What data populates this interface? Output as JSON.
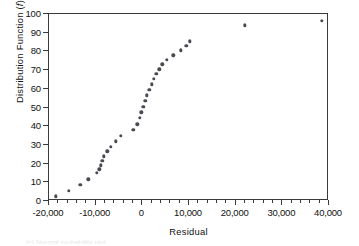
{
  "figure": {
    "background": "#ffffff",
    "marker_color": "#4a4a52",
    "axis_color": "#3a3a3a",
    "caption_remnant": "(c) Normal probability plot"
  },
  "chart_data": {
    "type": "scatter",
    "title": "",
    "xlabel": "Residual",
    "ylabel": "Distribution  Function (f)",
    "ylabel_plain": "Distribution Function",
    "ylabel_italic_symbol": "f",
    "xlim": [
      -20000,
      40000
    ],
    "ylim": [
      0,
      100
    ],
    "xticks": [
      -20000,
      -10000,
      0,
      10000,
      20000,
      30000,
      40000
    ],
    "xticklabels": [
      "-20,000",
      "-10,000",
      "0",
      "10,000",
      "20,000",
      "30,000",
      "40,000"
    ],
    "yticks": [
      0,
      10,
      20,
      30,
      40,
      50,
      60,
      70,
      80,
      90,
      100
    ],
    "yticklabels": [
      "0",
      "10",
      "20",
      "30",
      "40",
      "50",
      "60",
      "70",
      "80",
      "90",
      "100"
    ],
    "x_minor_tick_interval": 2000,
    "grid": false,
    "legend": false,
    "marker": "filled-circle",
    "n_points": 33,
    "x": [
      -18600,
      -15700,
      -13300,
      -11600,
      -9700,
      -9200,
      -8900,
      -8600,
      -8200,
      -7500,
      -6700,
      -5700,
      -4600,
      -1900,
      -1100,
      -600,
      -200,
      200,
      600,
      1000,
      1500,
      2000,
      2500,
      3000,
      3600,
      4300,
      5200,
      6600,
      8200,
      9400,
      10200,
      22000,
      38500
    ],
    "y": [
      2.5,
      5.5,
      8.5,
      11.5,
      15,
      17,
      19,
      21.5,
      24,
      26.5,
      29,
      32,
      35,
      38,
      41,
      44.5,
      47.5,
      50.5,
      53.5,
      56.5,
      59.5,
      62.5,
      65.5,
      68,
      70.5,
      73,
      75.5,
      78,
      80.5,
      83,
      85.5,
      94,
      96.5
    ]
  }
}
